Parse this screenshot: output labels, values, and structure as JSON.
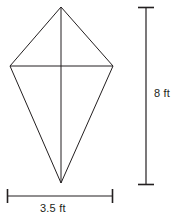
{
  "figure": {
    "shape_name": "kite",
    "stroke_color": "#231f20",
    "background_color": "#ffffff",
    "stroke_width": 1,
    "vertices": {
      "top": {
        "x": 61,
        "y": 7
      },
      "left": {
        "x": 10,
        "y": 66
      },
      "right": {
        "x": 113,
        "y": 66
      },
      "bottom": {
        "x": 61,
        "y": 183
      }
    },
    "diagonals": {
      "vertical": {
        "x1": 61,
        "y1": 7,
        "x2": 61,
        "y2": 183
      },
      "horizontal": {
        "x1": 10,
        "y1": 66,
        "x2": 113,
        "y2": 66
      }
    }
  },
  "dimensions": {
    "height": {
      "label": "8 ft",
      "value": 8,
      "unit": "ft",
      "orientation": "vertical",
      "bar": {
        "x": 146,
        "y_start": 7,
        "y_end": 185
      },
      "cap_half_length": 8
    },
    "width": {
      "label": "3.5 ft",
      "value": 3.5,
      "unit": "ft",
      "orientation": "horizontal",
      "bar": {
        "y": 196,
        "x_start": 7,
        "x_end": 113
      },
      "cap_half_length": 7
    }
  }
}
